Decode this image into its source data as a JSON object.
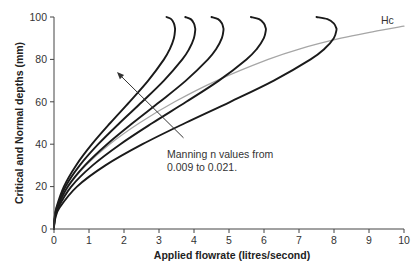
{
  "chart_data": {
    "type": "line",
    "title": "",
    "xlabel": "Applied flowrate (litres/second)",
    "ylabel": "Critical and Normal depths (mm)",
    "xlim": [
      0,
      10
    ],
    "ylim": [
      0,
      100
    ],
    "xticks": [
      0,
      1,
      2,
      3,
      4,
      5,
      6,
      7,
      8,
      9,
      10
    ],
    "yticks": [
      0,
      20,
      40,
      60,
      80,
      100
    ],
    "grid": false,
    "legend": "none",
    "depths_mm": [
      0,
      2,
      5,
      10,
      20,
      30,
      40,
      50,
      60,
      70,
      80,
      85,
      90,
      93.8,
      95,
      97,
      99,
      100
    ],
    "series": [
      {
        "name": "Normal depth n=0.009",
        "color": "#1a1a1a",
        "x": [
          0,
          0.005,
          0.036,
          0.157,
          0.657,
          1.469,
          2.528,
          3.75,
          5.039,
          6.28,
          7.331,
          7.73,
          7.994,
          8.07,
          8.059,
          7.994,
          7.814,
          7.5
        ]
      },
      {
        "name": "Normal depth n=0.012",
        "color": "#1a1a1a",
        "x": [
          0,
          0.004,
          0.027,
          0.117,
          0.493,
          1.102,
          1.896,
          2.813,
          3.779,
          4.71,
          5.498,
          5.797,
          5.995,
          6.053,
          6.044,
          5.995,
          5.861,
          5.625
        ]
      },
      {
        "name": "Normal depth n=0.015",
        "color": "#1a1a1a",
        "x": [
          0,
          0.003,
          0.022,
          0.094,
          0.394,
          0.882,
          1.517,
          2.25,
          3.023,
          3.768,
          4.399,
          4.638,
          4.796,
          4.842,
          4.835,
          4.796,
          4.689,
          4.5
        ]
      },
      {
        "name": "Normal depth n=0.018",
        "color": "#1a1a1a",
        "x": [
          0,
          0.003,
          0.018,
          0.078,
          0.329,
          0.735,
          1.264,
          1.875,
          2.519,
          3.14,
          3.666,
          3.865,
          3.997,
          4.035,
          4.029,
          3.997,
          3.907,
          3.75
        ]
      },
      {
        "name": "Normal depth n=0.021",
        "color": "#1a1a1a",
        "x": [
          0,
          0.002,
          0.015,
          0.067,
          0.282,
          0.63,
          1.083,
          1.607,
          2.159,
          2.691,
          3.142,
          3.312,
          3.426,
          3.458,
          3.454,
          3.426,
          3.349,
          3.214
        ]
      },
      {
        "name": "Hc",
        "color": "#a6a6a6",
        "points": [
          [
            0,
            0
          ],
          [
            0.027,
            5
          ],
          [
            0.106,
            10
          ],
          [
            0.414,
            20
          ],
          [
            0.913,
            30
          ],
          [
            1.59,
            40
          ],
          [
            2.44,
            50
          ],
          [
            3.45,
            60
          ],
          [
            4.65,
            70
          ],
          [
            6.12,
            80
          ],
          [
            7.03,
            85
          ],
          [
            8.2,
            90
          ],
          [
            9.1,
            93
          ],
          [
            10,
            95.7
          ]
        ]
      }
    ],
    "annotations": [
      {
        "text_lines": [
          "Manning n values from",
          "0.009 to 0.021."
        ],
        "arrow_from": [
          3.7,
          43
        ],
        "arrow_to": [
          1.8,
          74
        ]
      },
      {
        "text": "Hc",
        "at": [
          9.5,
          98
        ]
      }
    ]
  },
  "labels": {
    "xlabel": "Applied flowrate (litres/second)",
    "ylabel": "Critical and Normal depths (mm)",
    "annotation_line1": "Manning n values from",
    "annotation_line2": "0.009 to 0.021.",
    "hc_label": "Hc"
  },
  "colors": {
    "axis": "#444444",
    "curve": "#1a1a1a",
    "critical": "#a6a6a6"
  }
}
